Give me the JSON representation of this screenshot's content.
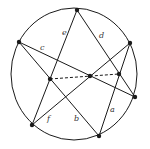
{
  "diagram": {
    "title": "",
    "colors": {
      "stroke": "#1a1a1a",
      "background": "#ffffff"
    },
    "circle": {
      "cx": 74,
      "cy": 74,
      "rx": 63,
      "ry": 66
    },
    "points": [
      {
        "id": "top",
        "x": 77,
        "y": 10
      },
      {
        "id": "left",
        "x": 19,
        "y": 42
      },
      {
        "id": "right-top",
        "x": 130,
        "y": 43
      },
      {
        "id": "right",
        "x": 135,
        "y": 97
      },
      {
        "id": "bottom-left",
        "x": 32,
        "y": 125
      },
      {
        "id": "bottom",
        "x": 99,
        "y": 136
      },
      {
        "id": "inner-left",
        "x": 50,
        "y": 79
      },
      {
        "id": "inner-center",
        "x": 90,
        "y": 76
      },
      {
        "id": "inner-right",
        "x": 119,
        "y": 74
      }
    ],
    "lines": [
      {
        "label": "e",
        "from": "top",
        "to": "bottom-left",
        "label_x": 62,
        "label_y": 35
      },
      {
        "label": "d",
        "from": "top",
        "to": "right",
        "label_x": 99,
        "label_y": 38
      },
      {
        "label": "c",
        "from": "left",
        "to": "right",
        "label_x": 40,
        "label_y": 50
      },
      {
        "label": "b",
        "from": "left",
        "to": "bottom",
        "label_x": 74,
        "label_y": 121
      },
      {
        "label": "f",
        "from": "bottom-left",
        "to": "right-top",
        "label_x": 47,
        "label_y": 121
      },
      {
        "label": "a",
        "from": "right-top",
        "to": "bottom",
        "label_x": 110,
        "label_y": 112
      }
    ],
    "dashed": {
      "from": "inner-left",
      "via": "inner-center",
      "to": "inner-right"
    },
    "labels": {
      "a": "a",
      "b": "b",
      "c": "c",
      "d": "d",
      "e": "e",
      "f": "f"
    }
  }
}
